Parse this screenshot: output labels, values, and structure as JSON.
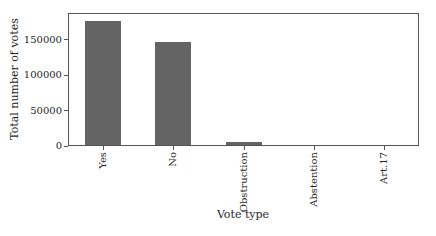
{
  "chart_data": {
    "type": "bar",
    "categories": [
      "Yes",
      "No",
      "Obstruction",
      "Abstention",
      "Art.17"
    ],
    "values": [
      176000,
      145000,
      4000,
      0,
      0
    ],
    "title": "",
    "xlabel": "Vote type",
    "ylabel": "Total number of votes",
    "ylim": [
      0,
      188000
    ],
    "yticks": [
      0,
      50000,
      100000,
      150000
    ],
    "grid": false,
    "legend": false,
    "bar_color": "#646464",
    "axis_color": "#555555",
    "text_color": "#1f1f1f",
    "background_color": "#ffffff"
  }
}
